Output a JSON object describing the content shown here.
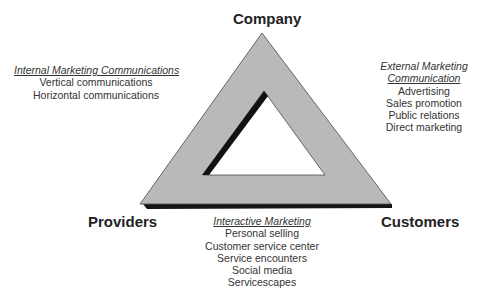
{
  "diagram": {
    "type": "services-marketing-triangle",
    "vertices": {
      "top": "Company",
      "bottom_left": "Providers",
      "bottom_right": "Customers"
    },
    "sides": {
      "left": {
        "title": "Internal Marketing Communications",
        "items": [
          "Vertical communications",
          "Horizontal communications"
        ]
      },
      "right": {
        "title_line1": "External Marketing",
        "title_line2": "Communication",
        "items": [
          "Advertising",
          "Sales promotion",
          "Public relations",
          "Direct marketing"
        ]
      },
      "bottom": {
        "title": "Interactive Marketing",
        "items": [
          "Personal selling",
          "Customer service center",
          "Service encounters",
          "Social media",
          "Servicescapes"
        ]
      }
    },
    "colors": {
      "triangle_fill": "#b8b8b8",
      "triangle_edge": "#3a3a3a",
      "shadow": "#111111",
      "background": "#ffffff"
    }
  }
}
